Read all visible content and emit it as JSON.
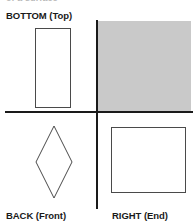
{
  "figure": {
    "clipped_header_text": "of a surface",
    "background_color": "#ffffff",
    "line_color": "#1a1a1a",
    "shape_stroke_color": "#4a4a4a",
    "shaded_fill_color": "#c9c9c9"
  },
  "labels": {
    "bottom_top": "BOTTOM (Top)",
    "back_front": "BACK (Front)",
    "right_end": "RIGHT (End)"
  },
  "quadrants": {
    "upper_right_shaded": {
      "shaded": true,
      "fill": "#c9c9c9"
    }
  },
  "shapes": {
    "bottom_view": {
      "type": "rectangle",
      "label": "BOTTOM (Top)",
      "quadrant": "upper-left"
    },
    "back_view": {
      "type": "diamond",
      "label": "BACK (Front)",
      "quadrant": "lower-left"
    },
    "right_view": {
      "type": "rectangle",
      "label": "RIGHT (End)",
      "quadrant": "lower-right"
    }
  },
  "axes": {
    "horizontal": "horizontal-axis-line",
    "vertical": "vertical-axis-line"
  }
}
